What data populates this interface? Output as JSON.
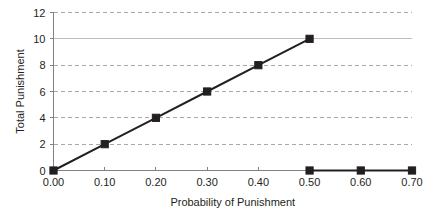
{
  "chart_data": {
    "type": "line",
    "title": "",
    "xlabel": "Probability of Punishment",
    "ylabel": "Total Punishment",
    "xlim": [
      0.0,
      0.7
    ],
    "ylim": [
      0,
      12
    ],
    "grid": true,
    "legend": "none",
    "xticks": [
      "0.00",
      "0.10",
      "0.20",
      "0.30",
      "0.40",
      "0.50",
      "0.60",
      "0.70"
    ],
    "xtick_values": [
      0.0,
      0.1,
      0.2,
      0.3,
      0.4,
      0.5,
      0.6,
      0.7
    ],
    "yticks": [
      "0",
      "2",
      "4",
      "6",
      "8",
      "10",
      "12"
    ],
    "ytick_values": [
      0,
      2,
      4,
      6,
      8,
      10,
      12
    ],
    "series": [
      {
        "name": "rising-punishment",
        "x": [
          0.0,
          0.1,
          0.2,
          0.3,
          0.4,
          0.5
        ],
        "values": [
          0,
          2,
          4,
          6,
          8,
          10
        ],
        "color": "#231f20",
        "marker": "square"
      },
      {
        "name": "zero-punishment",
        "x": [
          0.5,
          0.6,
          0.7
        ],
        "values": [
          0,
          0,
          0
        ],
        "color": "#231f20",
        "marker": "square"
      }
    ],
    "gridline_solid_at_y": 10,
    "colors": {
      "line": "#231f20",
      "marker": "#231f20",
      "grid_dashed": "#a7a9ac",
      "grid_solid": "#bcbec0",
      "axis": "#808285",
      "text": "#231f20",
      "background": "#ffffff"
    }
  }
}
